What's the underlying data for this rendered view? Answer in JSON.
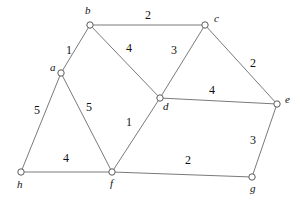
{
  "diagram": {
    "type": "weighted-undirected-graph",
    "background_color": "#ffffff",
    "edge_color": "#7a7a7a",
    "node_fill": "#ffffff",
    "node_stroke": "#5a5a5a",
    "text_color": "#111111",
    "nodes": [
      {
        "id": "a",
        "label": "a",
        "x": 61,
        "y": 73,
        "label_x": 50,
        "label_y": 71
      },
      {
        "id": "b",
        "label": "b",
        "x": 90,
        "y": 25,
        "label_x": 85,
        "label_y": 14
      },
      {
        "id": "c",
        "label": "c",
        "x": 205,
        "y": 25,
        "label_x": 214,
        "label_y": 22
      },
      {
        "id": "d",
        "label": "d",
        "x": 160,
        "y": 98,
        "label_x": 163,
        "label_y": 110
      },
      {
        "id": "e",
        "label": "e",
        "x": 277,
        "y": 104,
        "label_x": 285,
        "label_y": 103
      },
      {
        "id": "f",
        "label": "f",
        "x": 112,
        "y": 172,
        "label_x": 110,
        "label_y": 187
      },
      {
        "id": "g",
        "label": "g",
        "x": 252,
        "y": 177,
        "label_x": 250,
        "label_y": 192
      },
      {
        "id": "h",
        "label": "h",
        "x": 21,
        "y": 172,
        "label_x": 17,
        "label_y": 188
      }
    ],
    "edges": [
      {
        "from": "b",
        "to": "c",
        "weight": "2",
        "label_x": 148,
        "label_y": 19
      },
      {
        "from": "a",
        "to": "b",
        "weight": "1",
        "label_x": 69,
        "label_y": 54
      },
      {
        "from": "b",
        "to": "d",
        "weight": "4",
        "label_x": 129,
        "label_y": 52
      },
      {
        "from": "c",
        "to": "d",
        "weight": "3",
        "label_x": 174,
        "label_y": 54
      },
      {
        "from": "c",
        "to": "e",
        "weight": "2",
        "label_x": 253,
        "label_y": 67
      },
      {
        "from": "a",
        "to": "h",
        "weight": "5",
        "label_x": 37,
        "label_y": 114
      },
      {
        "from": "a",
        "to": "f",
        "weight": "5",
        "label_x": 89,
        "label_y": 111
      },
      {
        "from": "d",
        "to": "f",
        "weight": "1",
        "label_x": 129,
        "label_y": 126
      },
      {
        "from": "d",
        "to": "e",
        "weight": "4",
        "label_x": 212,
        "label_y": 94
      },
      {
        "from": "e",
        "to": "g",
        "weight": "3",
        "label_x": 253,
        "label_y": 144
      },
      {
        "from": "h",
        "to": "f",
        "weight": "4",
        "label_x": 66,
        "label_y": 162
      },
      {
        "from": "f",
        "to": "g",
        "weight": "2",
        "label_x": 188,
        "label_y": 164
      }
    ]
  }
}
